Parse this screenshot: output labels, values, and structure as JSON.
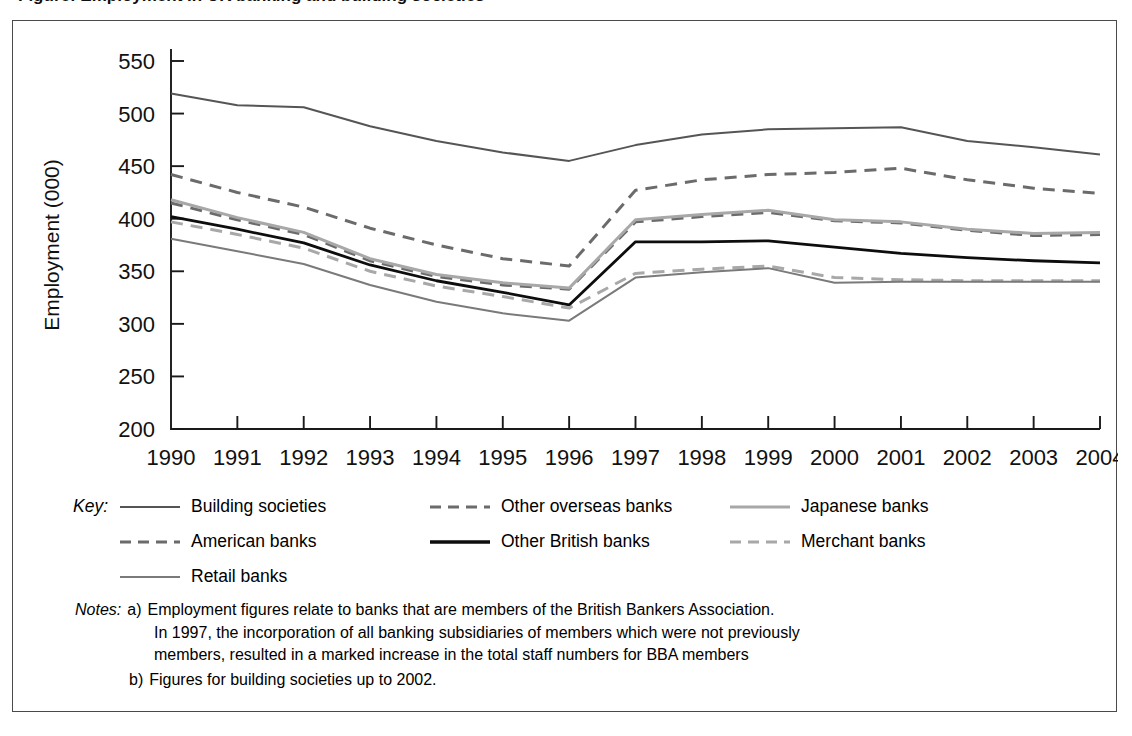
{
  "figure": {
    "title_sliver": "Figure: Employment in UK banking and building societies",
    "frame_color": "#4a4a4a"
  },
  "chart_data": {
    "type": "line",
    "title": "",
    "xlabel": "",
    "ylabel": "Employment (000)",
    "categories": [
      1990,
      1991,
      1992,
      1993,
      1994,
      1995,
      1996,
      1997,
      1998,
      1999,
      2000,
      2001,
      2002,
      2003,
      2004
    ],
    "x": [
      "1990",
      "1991",
      "1992",
      "1993",
      "1994",
      "1995",
      "1996",
      "1997",
      "1998",
      "1999",
      "2000",
      "2001",
      "2002",
      "2003",
      "2004"
    ],
    "ylim": [
      200,
      550
    ],
    "yticks": [
      200,
      250,
      300,
      350,
      400,
      450,
      500,
      550
    ],
    "grid": false,
    "legend_position": "below",
    "series": [
      {
        "name": "Building societies",
        "color": "#555555",
        "style": "solid",
        "width": 2.0,
        "values": [
          519,
          508,
          506,
          488,
          474,
          463,
          455,
          470,
          480,
          485,
          486,
          487,
          474,
          468,
          461
        ]
      },
      {
        "name": "American banks",
        "color": "#6b6b6b",
        "style": "dashed",
        "width": 3.0,
        "values": [
          442,
          425,
          411,
          391,
          375,
          362,
          355,
          427,
          437,
          442,
          444,
          448,
          437,
          429,
          424
        ]
      },
      {
        "name": "Other overseas banks",
        "color": "#6b6b6b",
        "style": "dashed",
        "width": 3.0,
        "values": [
          415,
          399,
          385,
          360,
          345,
          337,
          333,
          397,
          402,
          406,
          398,
          396,
          389,
          384,
          385
        ]
      },
      {
        "name": "Japanese banks",
        "color": "#a8a8a8",
        "style": "solid",
        "width": 3.0,
        "values": [
          418,
          401,
          387,
          362,
          347,
          339,
          334,
          399,
          404,
          408,
          399,
          397,
          390,
          386,
          387
        ]
      },
      {
        "name": "Other British banks",
        "color": "#0d0d0d",
        "style": "solid",
        "width": 2.8,
        "values": [
          402,
          390,
          377,
          356,
          341,
          330,
          318,
          378,
          378,
          379,
          373,
          367,
          363,
          360,
          358
        ]
      },
      {
        "name": "Merchant banks",
        "color": "#a8a8a8",
        "style": "dashed",
        "width": 3.0,
        "values": [
          397,
          385,
          372,
          350,
          336,
          326,
          315,
          348,
          352,
          355,
          344,
          342,
          341,
          341,
          341
        ]
      },
      {
        "name": "Retail banks",
        "color": "#7a7a7a",
        "style": "solid",
        "width": 2.0,
        "values": [
          381,
          369,
          357,
          337,
          321,
          310,
          303,
          344,
          349,
          353,
          339,
          340,
          340,
          340,
          340
        ]
      }
    ]
  },
  "legend": {
    "key_label": "Key:",
    "rows": [
      [
        {
          "name": "Building societies",
          "style": "solid",
          "color": "#555555",
          "width": 2.0
        },
        {
          "name": "Other overseas banks",
          "style": "dashed",
          "color": "#6b6b6b",
          "width": 3.0
        },
        {
          "name": "Japanese banks",
          "style": "solid",
          "color": "#a8a8a8",
          "width": 3.0
        }
      ],
      [
        {
          "name": "American banks",
          "style": "dashed",
          "color": "#6b6b6b",
          "width": 3.0
        },
        {
          "name": "Other British banks",
          "style": "solid",
          "color": "#0d0d0d",
          "width": 3.4
        },
        {
          "name": "Merchant banks",
          "style": "dashed",
          "color": "#a8a8a8",
          "width": 3.0
        }
      ],
      [
        {
          "name": "Retail banks",
          "style": "solid",
          "color": "#7a7a7a",
          "width": 2.0
        }
      ]
    ]
  },
  "notes": {
    "label": "Notes:",
    "items": [
      {
        "marker": "a)",
        "lines": [
          "Employment figures relate to banks that are members of the British Bankers Association.",
          "In 1997, the incorporation of all banking subsidiaries of members which were not previously",
          "members, resulted in a marked increase in the total staff numbers for BBA members"
        ]
      },
      {
        "marker": "b)",
        "lines": [
          "Figures for building societies up to 2002."
        ]
      }
    ]
  }
}
